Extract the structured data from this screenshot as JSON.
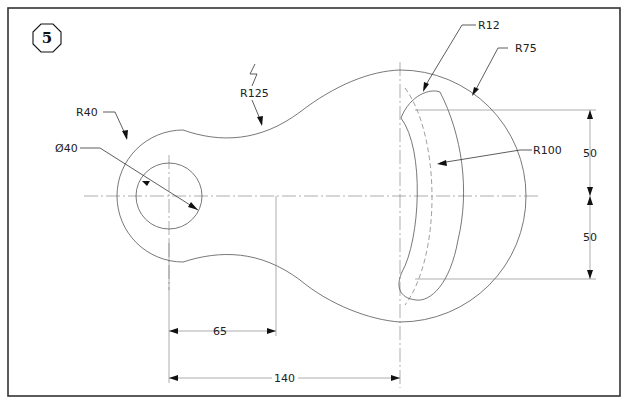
{
  "drawing": {
    "number": "5",
    "type": "2D mechanical link plate drawing",
    "border_color": "#333333",
    "line_color": "#555555"
  },
  "dimensions": {
    "r40": "R40",
    "dia40": "Ø40",
    "r125": "R125",
    "r12": "R12",
    "r75": "R75",
    "r100": "R100",
    "v50_top": "50",
    "v50_bottom": "50",
    "h65": "65",
    "h140": "140"
  }
}
